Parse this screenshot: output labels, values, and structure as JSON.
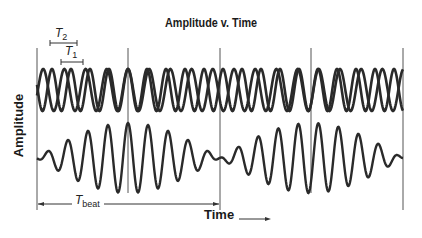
{
  "title": "Amplitude v. Time",
  "ylabel": "Amplitude",
  "xlabel": "Time",
  "annotations": {
    "T1": {
      "symbol": "T",
      "subscript": "1"
    },
    "T2": {
      "symbol": "T",
      "subscript": "2"
    },
    "Tbeat": {
      "symbol": "T",
      "subscript": "beat"
    }
  },
  "colors": {
    "wave": "#2a2a2a",
    "gridline": "#555555",
    "text": "#1a1a1a"
  },
  "chart_data": {
    "type": "line",
    "title": "Amplitude v. Time",
    "xlabel": "Time",
    "ylabel": "Amplitude",
    "panels": [
      {
        "name": "component waves",
        "series": [
          {
            "name": "wave 1",
            "period_label": "T1",
            "period_px": 19
          },
          {
            "name": "wave 2",
            "period_label": "T2",
            "period_px": 21.2
          }
        ]
      },
      {
        "name": "superposition (beat)",
        "beat_period_label": "Tbeat",
        "beat_period_px": 183
      }
    ],
    "vertical_markers_px": [
      37,
      128,
      220,
      311,
      403
    ],
    "grid": false
  }
}
